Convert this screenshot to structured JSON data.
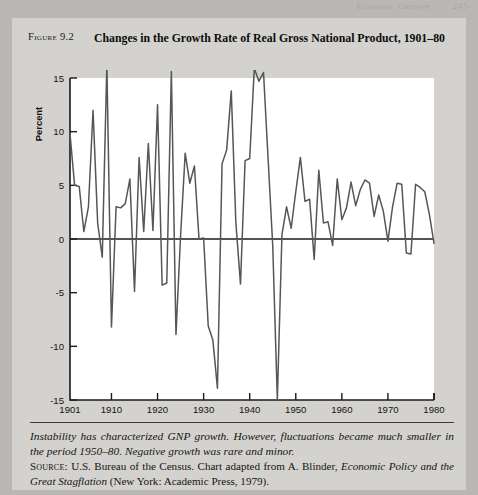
{
  "running_head": {
    "title": "Economic Growth",
    "page": "245"
  },
  "figure": {
    "label": "Figure 9.2",
    "title": "Changes in the Growth Rate of Real Gross National Product, 1901–80",
    "note_line": "Instability has characterized GNP growth.  However, fluctuations became much smaller in the period 1950–80.  Negative growth was rare and minor.",
    "source_prefix": "Source:",
    "source_text_1": " U.S. Bureau of the Census.  Chart adapted from A. Blinder, ",
    "source_italic_1": "Economic Policy and the Great Stagflation",
    "source_text_2": " (New York: Academic Press, 1979)."
  },
  "chart_data": {
    "type": "line",
    "title": "Changes in the Growth Rate of Real Gross National Product, 1901–80",
    "xlabel": "Year",
    "ylabel": "Percent",
    "xlim": [
      1901,
      1980
    ],
    "ylim": [
      -15,
      15
    ],
    "ytick_values": [
      15,
      10,
      5,
      0,
      -5,
      -10,
      -15
    ],
    "ytick_labels": [
      "15",
      "10",
      "5",
      "0",
      "-5",
      "-10",
      "-15"
    ],
    "xtick_values": [
      1901,
      1910,
      1920,
      1930,
      1940,
      1950,
      1960,
      1970,
      1980
    ],
    "xtick_labels": [
      "1901",
      "1910",
      "1920",
      "1930",
      "1940",
      "1950",
      "1960",
      "1970",
      "1980"
    ],
    "grid": false,
    "legend": null,
    "zero_line": 0,
    "line_color": "#565654",
    "plot_background": "#ffffff",
    "series": [
      {
        "name": "Real GNP growth rate",
        "x": [
          1901,
          1902,
          1903,
          1904,
          1905,
          1906,
          1907,
          1908,
          1909,
          1910,
          1911,
          1912,
          1913,
          1914,
          1915,
          1916,
          1917,
          1918,
          1919,
          1920,
          1921,
          1922,
          1923,
          1924,
          1925,
          1926,
          1927,
          1928,
          1929,
          1930,
          1931,
          1932,
          1933,
          1934,
          1935,
          1936,
          1937,
          1938,
          1939,
          1940,
          1941,
          1942,
          1943,
          1944,
          1945,
          1946,
          1947,
          1948,
          1949,
          1950,
          1951,
          1952,
          1953,
          1954,
          1955,
          1956,
          1957,
          1958,
          1959,
          1960,
          1961,
          1962,
          1963,
          1964,
          1965,
          1966,
          1967,
          1968,
          1969,
          1970,
          1971,
          1972,
          1973,
          1974,
          1975,
          1976,
          1977,
          1978,
          1979,
          1980
        ],
        "y": [
          9.8,
          5.0,
          4.9,
          0.7,
          3.0,
          12.0,
          1.5,
          -1.7,
          16.3,
          -8.2,
          3.0,
          2.9,
          3.3,
          5.6,
          -4.9,
          7.6,
          0.7,
          8.9,
          0.8,
          12.5,
          -4.3,
          -4.1,
          15.6,
          -8.9,
          0.3,
          8.0,
          5.2,
          6.8,
          0.0,
          0.1,
          -8.1,
          -9.4,
          -13.9,
          7.0,
          8.3,
          13.8,
          1.5,
          -4.2,
          7.3,
          7.5,
          15.9,
          14.7,
          15.5,
          7.4,
          -0.6,
          -15.0,
          0.4,
          3.0,
          1.0,
          4.4,
          7.6,
          3.5,
          3.7,
          -1.9,
          6.4,
          1.5,
          1.6,
          -0.6,
          5.6,
          1.8,
          2.9,
          5.3,
          3.1,
          4.6,
          5.5,
          5.2,
          2.1,
          4.1,
          2.6,
          -0.2,
          3.0,
          5.2,
          5.1,
          -1.3,
          -1.4,
          5.1,
          4.8,
          4.4,
          2.3,
          -0.4
        ]
      }
    ]
  }
}
